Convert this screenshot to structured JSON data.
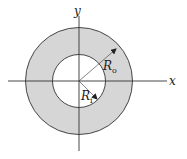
{
  "diagram": {
    "type": "annulus",
    "title": "",
    "axes": {
      "x_label": "x",
      "y_label": "y"
    },
    "outer_radius": {
      "label_main": "R",
      "label_sub": "o"
    },
    "inner_radius": {
      "label_main": "R",
      "label_sub": "i"
    },
    "colors": {
      "ring_fill": "#d6d6d6",
      "stroke": "#333333",
      "background": "#ffffff"
    }
  }
}
